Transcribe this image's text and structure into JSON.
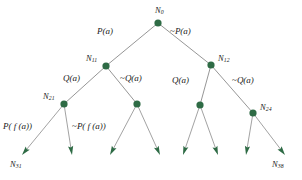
{
  "diagram": {
    "node_color": "#2e6b45",
    "edge_color": "#8a8a8a",
    "text_color": "#1a1a1a",
    "background": "#ffffff",
    "node_radius": 3.6,
    "nodes": [
      {
        "id": "N0",
        "label_main": "N",
        "label_sub": "0",
        "x": 158,
        "y": 23,
        "label_x": 155,
        "label_y": 6,
        "label_anchor": "center",
        "drawn": true
      },
      {
        "id": "N11",
        "label_main": "N",
        "label_sub": "11",
        "x": 106,
        "y": 66,
        "label_x": 86,
        "label_y": 54,
        "label_anchor": "left",
        "drawn": true
      },
      {
        "id": "N12",
        "label_main": "N",
        "label_sub": "12",
        "x": 211,
        "y": 65,
        "label_x": 218,
        "label_y": 54,
        "label_anchor": "left",
        "drawn": true
      },
      {
        "id": "N21",
        "label_main": "N",
        "label_sub": "21",
        "x": 64,
        "y": 104,
        "label_x": 43,
        "label_y": 92,
        "label_anchor": "left",
        "drawn": true
      },
      {
        "id": "N22",
        "label_main": "",
        "label_sub": "",
        "x": 137,
        "y": 104,
        "label_x": 0,
        "label_y": 0,
        "label_anchor": "left",
        "drawn": false
      },
      {
        "id": "N23",
        "label_main": "",
        "label_sub": "",
        "x": 200,
        "y": 105,
        "label_x": 0,
        "label_y": 0,
        "label_anchor": "left",
        "drawn": false
      },
      {
        "id": "N24",
        "label_main": "N",
        "label_sub": "24",
        "x": 253,
        "y": 113,
        "label_x": 260,
        "label_y": 103,
        "label_anchor": "left",
        "drawn": true
      }
    ],
    "leaves": [
      {
        "id": "L1",
        "from_x": 64,
        "from_y": 104,
        "to_x": 22,
        "to_y": 155,
        "label_main": "N",
        "label_sub": "31",
        "label_x": 10,
        "label_y": 160,
        "labelled": true
      },
      {
        "id": "L2",
        "from_x": 64,
        "from_y": 104,
        "to_x": 72,
        "to_y": 155,
        "label_main": "",
        "label_sub": "",
        "label_x": 0,
        "label_y": 0,
        "labelled": false
      },
      {
        "id": "L3",
        "from_x": 137,
        "from_y": 104,
        "to_x": 110,
        "to_y": 155,
        "label_main": "",
        "label_sub": "",
        "label_x": 0,
        "label_y": 0,
        "labelled": false
      },
      {
        "id": "L4",
        "from_x": 137,
        "from_y": 104,
        "to_x": 160,
        "to_y": 155,
        "label_main": "",
        "label_sub": "",
        "label_x": 0,
        "label_y": 0,
        "labelled": false
      },
      {
        "id": "L5",
        "from_x": 200,
        "from_y": 105,
        "to_x": 183,
        "to_y": 155,
        "label_main": "",
        "label_sub": "",
        "label_x": 0,
        "label_y": 0,
        "labelled": false
      },
      {
        "id": "L6",
        "from_x": 200,
        "from_y": 105,
        "to_x": 218,
        "to_y": 155,
        "label_main": "",
        "label_sub": "",
        "label_x": 0,
        "label_y": 0,
        "labelled": false
      },
      {
        "id": "L7",
        "from_x": 253,
        "from_y": 113,
        "to_x": 246,
        "to_y": 155,
        "label_main": "",
        "label_sub": "",
        "label_x": 0,
        "label_y": 0,
        "labelled": false
      },
      {
        "id": "L8",
        "from_x": 253,
        "from_y": 113,
        "to_x": 285,
        "to_y": 155,
        "label_main": "N",
        "label_sub": "38",
        "label_x": 272,
        "label_y": 160,
        "labelled": true
      }
    ],
    "branch_edges": [
      {
        "id": "E0L",
        "from": "N0",
        "to": "N11"
      },
      {
        "id": "E0R",
        "from": "N0",
        "to": "N12"
      },
      {
        "id": "E1L",
        "from": "N11",
        "to": "N21"
      },
      {
        "id": "E1R",
        "from": "N11",
        "to": "N22"
      },
      {
        "id": "E2L",
        "from": "N12",
        "to": "N23"
      },
      {
        "id": "E2R",
        "from": "N12",
        "to": "N24"
      }
    ],
    "edge_labels": [
      {
        "id": "lbl-P-a",
        "text": "P(a)",
        "neg": false,
        "x": 113,
        "y": 27,
        "anchor": "right"
      },
      {
        "id": "lbl-not-P-a",
        "text": "P(a)",
        "neg": true,
        "x": 170,
        "y": 27,
        "anchor": "left"
      },
      {
        "id": "lbl-Q-a-left",
        "text": "Q(a)",
        "neg": false,
        "x": 63,
        "y": 74,
        "anchor": "left"
      },
      {
        "id": "lbl-not-Q-a-left",
        "text": "Q(a)",
        "neg": true,
        "x": 120,
        "y": 74,
        "anchor": "left"
      },
      {
        "id": "lbl-Q-a-right",
        "text": "Q(a)",
        "neg": false,
        "x": 172,
        "y": 76,
        "anchor": "left"
      },
      {
        "id": "lbl-not-Q-a-right",
        "text": "Q(a)",
        "neg": true,
        "x": 232,
        "y": 76,
        "anchor": "left"
      },
      {
        "id": "lbl-P-fa",
        "text": "P( f (a))",
        "neg": false,
        "x": 3,
        "y": 122,
        "anchor": "left"
      },
      {
        "id": "lbl-not-P-fa",
        "text": "P( f (a))",
        "neg": true,
        "x": 72,
        "y": 122,
        "anchor": "left"
      }
    ]
  }
}
